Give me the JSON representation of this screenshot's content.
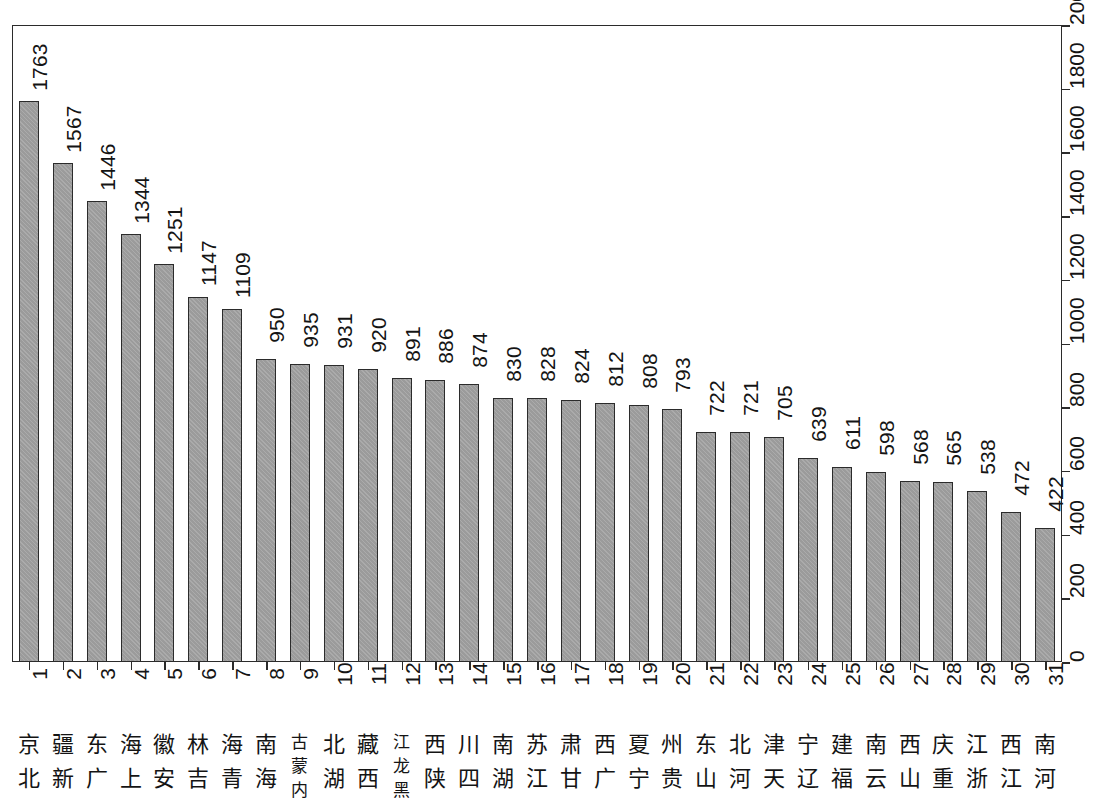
{
  "chart_data": {
    "type": "bar",
    "title": "",
    "subtitle": "",
    "xlabel": "",
    "ylabel": "",
    "orientation": "vertical",
    "grid": false,
    "legend": null,
    "ylim": [
      0,
      2000
    ],
    "y_ticks": [
      0,
      200,
      400,
      600,
      800,
      1000,
      1200,
      1400,
      1600,
      1800,
      2000
    ],
    "y_tick_labels": [
      "0",
      "200",
      "400",
      "600",
      "800",
      "1000",
      "1200",
      "1400",
      "1600",
      "1800",
      "2000"
    ],
    "rank_labels": [
      "1",
      "2",
      "3",
      "4",
      "5",
      "6",
      "7",
      "8",
      "9",
      "10",
      "11",
      "12",
      "13",
      "14",
      "15",
      "16",
      "17",
      "18",
      "19",
      "20",
      "21",
      "22",
      "23",
      "24",
      "25",
      "26",
      "27",
      "28",
      "29",
      "30",
      "31"
    ],
    "categories": [
      "北京",
      "新疆",
      "广东",
      "上海",
      "安徽",
      "吉林",
      "青海",
      "海南",
      "内蒙古",
      "湖北",
      "西藏",
      "黑龙江",
      "陕西",
      "四川",
      "湖南",
      "江苏",
      "甘肃",
      "广西",
      "宁夏",
      "贵州",
      "山东",
      "河北",
      "天津",
      "辽宁",
      "福建",
      "云南",
      "山西",
      "重庆",
      "浙江",
      "江西",
      "河南"
    ],
    "values": [
      1763,
      1567,
      1446,
      1344,
      1251,
      1147,
      1109,
      950,
      935,
      931,
      920,
      891,
      886,
      874,
      830,
      828,
      824,
      812,
      808,
      793,
      722,
      721,
      705,
      639,
      611,
      598,
      568,
      565,
      538,
      472,
      422
    ],
    "bar_color": "#9b9b9b",
    "bar_border_color": "#2b2b2b",
    "axis_color": "#2b2b2b",
    "background_color": "#ffffff"
  }
}
